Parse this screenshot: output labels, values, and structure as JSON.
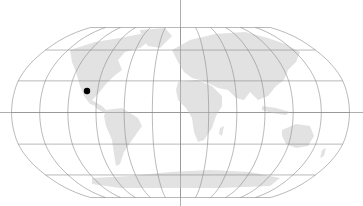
{
  "map": {
    "projection": "robinson",
    "graticule_step_deg": 30,
    "land_color": "#e2e2e2",
    "graticule_color": "#8a8a8a",
    "axis_color": "#8a8a8a",
    "background": "#ffffff",
    "marker": {
      "label": "Location marker",
      "color": "#000000",
      "lon": -107,
      "lat": 23,
      "x": 87,
      "y": 91
    }
  }
}
